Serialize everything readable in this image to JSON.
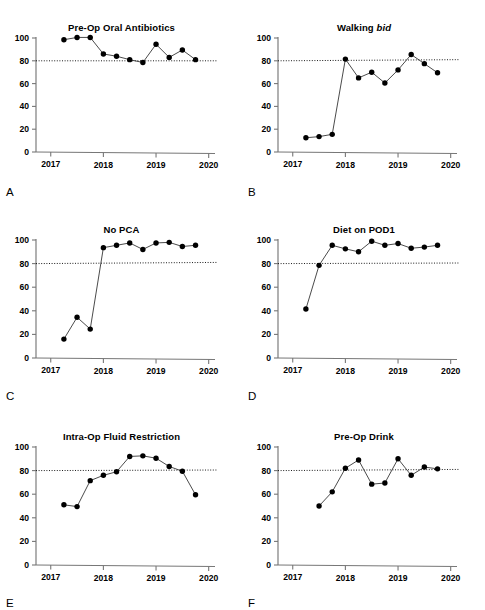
{
  "figure": {
    "panel_label_positions": "below each x-axis, left aligned",
    "panels": [
      {
        "letter": "A",
        "title": "Pre-Op Oral Antibiotics",
        "title_italic_part": "",
        "chart_data": {
          "type": "line",
          "title": "Pre-Op Oral Antibiotics",
          "xlabel": "",
          "ylabel": "",
          "xlim": [
            2016.72,
            2020.12
          ],
          "ylim": [
            0,
            100
          ],
          "xticks": [
            2017,
            2018,
            2019,
            2020
          ],
          "xtick_labels": [
            "2017",
            "2018",
            "2019",
            "2020"
          ],
          "yticks": [
            0,
            20,
            40,
            60,
            80,
            100
          ],
          "ytick_labels": [
            "0",
            "20",
            "40",
            "60",
            "80",
            "100"
          ],
          "grid": false,
          "legend": "none",
          "threshold_line": {
            "value": 80,
            "style": "dotted",
            "label": "80% target"
          },
          "x": [
            2017.25,
            2017.5,
            2017.75,
            2018.0,
            2018.25,
            2018.5,
            2018.75,
            2019.0,
            2019.25,
            2019.5,
            2019.75
          ],
          "values": [
            98.5,
            100.5,
            100.5,
            86,
            84,
            81,
            78.5,
            94.5,
            83,
            89.5,
            81
          ]
        }
      },
      {
        "letter": "B",
        "title": "Walking bid",
        "title_italic_part": "bid",
        "chart_data": {
          "type": "line",
          "title": "Walking bid",
          "xlabel": "",
          "ylabel": "",
          "xlim": [
            2016.72,
            2020.12
          ],
          "ylim": [
            0,
            100
          ],
          "xticks": [
            2017,
            2018,
            2019,
            2020
          ],
          "xtick_labels": [
            "2017",
            "2018",
            "2019",
            "2020"
          ],
          "yticks": [
            0,
            20,
            40,
            60,
            80,
            100
          ],
          "ytick_labels": [
            "0",
            "20",
            "40",
            "60",
            "80",
            "100"
          ],
          "grid": false,
          "legend": "none",
          "threshold_line": {
            "value": 81,
            "style": "dotted",
            "label": "80% target"
          },
          "x": [
            2017.25,
            2017.5,
            2017.75,
            2018.0,
            2018.25,
            2018.5,
            2018.75,
            2019.0,
            2019.25,
            2019.5,
            2019.75
          ],
          "values": [
            12.5,
            13.5,
            15.5,
            81.5,
            65,
            70,
            60.5,
            72,
            85.5,
            77.5,
            69.5
          ]
        }
      },
      {
        "letter": "C",
        "title": "No PCA",
        "title_italic_part": "",
        "chart_data": {
          "type": "line",
          "title": "No PCA",
          "xlabel": "",
          "ylabel": "",
          "xlim": [
            2016.72,
            2020.12
          ],
          "ylim": [
            0,
            100
          ],
          "xticks": [
            2017,
            2018,
            2019,
            2020
          ],
          "xtick_labels": [
            "2017",
            "2018",
            "2019",
            "2020"
          ],
          "yticks": [
            0,
            20,
            40,
            60,
            80,
            100
          ],
          "ytick_labels": [
            "0",
            "20",
            "40",
            "60",
            "80",
            "100"
          ],
          "grid": false,
          "legend": "none",
          "threshold_line": {
            "value": 81,
            "style": "dotted",
            "label": "80% target"
          },
          "x": [
            2017.25,
            2017.5,
            2017.75,
            2018.0,
            2018.25,
            2018.5,
            2018.75,
            2019.0,
            2019.25,
            2019.5,
            2019.75
          ],
          "values": [
            16,
            34.5,
            24.5,
            93.5,
            95.5,
            97.5,
            92,
            97.5,
            98,
            94.5,
            95.5
          ]
        }
      },
      {
        "letter": "D",
        "title": "Diet on POD1",
        "title_italic_part": "",
        "chart_data": {
          "type": "line",
          "title": "Diet on POD1",
          "xlabel": "",
          "ylabel": "",
          "xlim": [
            2016.72,
            2020.12
          ],
          "ylim": [
            0,
            100
          ],
          "xticks": [
            2017,
            2018,
            2019,
            2020
          ],
          "xtick_labels": [
            "2017",
            "2018",
            "2019",
            "2020"
          ],
          "yticks": [
            0,
            20,
            40,
            60,
            80,
            100
          ],
          "ytick_labels": [
            "0",
            "20",
            "40",
            "60",
            "80",
            "100"
          ],
          "grid": false,
          "legend": "none",
          "threshold_line": {
            "value": 80.5,
            "style": "dotted",
            "label": "80% target"
          },
          "x": [
            2017.25,
            2017.5,
            2017.75,
            2018.0,
            2018.25,
            2018.5,
            2018.75,
            2019.0,
            2019.25,
            2019.5,
            2019.75
          ],
          "values": [
            41.5,
            78.5,
            95.5,
            92.5,
            90,
            99,
            95.5,
            97,
            93,
            94,
            95.5
          ]
        }
      },
      {
        "letter": "E",
        "title": "Intra-Op Fluid Restriction",
        "title_italic_part": "",
        "chart_data": {
          "type": "line",
          "title": "Intra-Op Fluid Restriction",
          "xlabel": "",
          "ylabel": "",
          "xlim": [
            2016.72,
            2020.12
          ],
          "ylim": [
            0,
            100
          ],
          "xticks": [
            2017,
            2018,
            2019,
            2020
          ],
          "xtick_labels": [
            "2017",
            "2018",
            "2019",
            "2020"
          ],
          "yticks": [
            0,
            20,
            40,
            60,
            80,
            100
          ],
          "ytick_labels": [
            "0",
            "20",
            "40",
            "60",
            "80",
            "100"
          ],
          "grid": false,
          "legend": "none",
          "threshold_line": {
            "value": 80.5,
            "style": "dotted",
            "label": "80% target"
          },
          "x": [
            2017.25,
            2017.5,
            2017.75,
            2018.0,
            2018.25,
            2018.5,
            2018.75,
            2019.0,
            2019.25,
            2019.5,
            2019.75
          ],
          "values": [
            51,
            49.5,
            71.5,
            76,
            79,
            92,
            92.5,
            90.5,
            83.5,
            79.5,
            59.5
          ]
        }
      },
      {
        "letter": "F",
        "title": "Pre-Op Drink",
        "title_italic_part": "",
        "chart_data": {
          "type": "line",
          "title": "Pre-Op Drink",
          "xlabel": "",
          "ylabel": "",
          "xlim": [
            2016.72,
            2020.12
          ],
          "ylim": [
            0,
            100
          ],
          "xticks": [
            2017,
            2018,
            2019,
            2020
          ],
          "xtick_labels": [
            "2017",
            "2018",
            "2019",
            "2020"
          ],
          "yticks": [
            0,
            20,
            40,
            60,
            80,
            100
          ],
          "ytick_labels": [
            "0",
            "20",
            "40",
            "60",
            "80",
            "100"
          ],
          "grid": false,
          "legend": "none",
          "threshold_line": {
            "value": 81,
            "style": "dotted",
            "label": "80% target"
          },
          "x": [
            2017.5,
            2017.75,
            2018.0,
            2018.25,
            2018.5,
            2018.75,
            2019.0,
            2019.25,
            2019.5,
            2019.75
          ],
          "values": [
            50,
            62,
            82,
            89,
            68.5,
            69.5,
            90,
            76,
            83,
            81.5
          ]
        }
      }
    ]
  },
  "colors": {
    "line": "#2b2b2b",
    "point": "#000000",
    "axis": "#777777",
    "threshold": "#000000",
    "background": "#ffffff"
  }
}
